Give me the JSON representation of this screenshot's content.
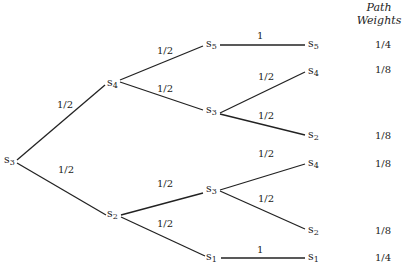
{
  "header": {
    "line1": "Path",
    "line2": "Weights"
  },
  "nodes": {
    "root": {
      "name": "s",
      "sub": "3"
    },
    "l1_top": {
      "name": "s",
      "sub": "4"
    },
    "l1_bottom": {
      "name": "s",
      "sub": "2"
    },
    "l2_a": {
      "name": "s",
      "sub": "5"
    },
    "l2_b": {
      "name": "s",
      "sub": "3"
    },
    "l2_c": {
      "name": "s",
      "sub": "3"
    },
    "l2_d": {
      "name": "s",
      "sub": "1"
    },
    "leaf_1": {
      "name": "s",
      "sub": "5"
    },
    "leaf_2": {
      "name": "s",
      "sub": "4"
    },
    "leaf_3": {
      "name": "s",
      "sub": "2"
    },
    "leaf_4": {
      "name": "s",
      "sub": "4"
    },
    "leaf_5": {
      "name": "s",
      "sub": "2"
    },
    "leaf_6": {
      "name": "s",
      "sub": "1"
    }
  },
  "edges": {
    "root_to_s4": "1/2",
    "root_to_s2": "1/2",
    "s4_to_s5": "1/2",
    "s4_to_s3": "1/2",
    "s2_to_s3": "1/2",
    "s2_to_s1": "1/2",
    "s5_to_s5": "1",
    "s3a_to_s4": "1/2",
    "s3a_to_s2": "1/2",
    "s3b_to_s4": "1/2",
    "s3b_to_s2": "1/2",
    "s1_to_s1": "1"
  },
  "weights": [
    "1/4",
    "1/8",
    "1/8",
    "1/8",
    "1/8",
    "1/4"
  ]
}
